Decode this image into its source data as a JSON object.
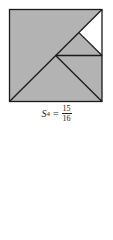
{
  "figure": {
    "colors": {
      "shaded": "#b3b3b3",
      "unshaded": "#ffffff",
      "stroke": "#1a1a1a"
    }
  },
  "caption": {
    "symbol": "S",
    "subscript": "4",
    "equals": "=",
    "numerator": "15",
    "denominator": "16"
  }
}
